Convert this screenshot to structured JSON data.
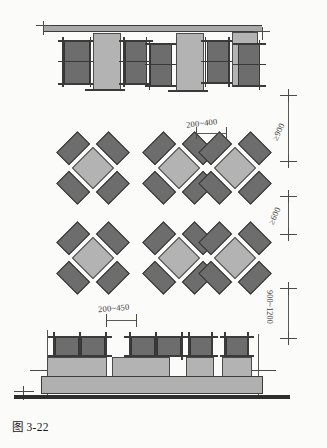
{
  "figure": {
    "caption": "图 3-22",
    "caption_number": "3-22"
  },
  "colors": {
    "background": "#fbfbfa",
    "table_fill": "#b3b3b3",
    "chair_fill": "#6d6d6d",
    "outline": "#3c3c3c",
    "dimension_line": "#5a5a5a",
    "floor_line": "#2e2e2e"
  },
  "dimensions": [
    {
      "id": "dim-clearance-900",
      "label": "≥900",
      "orientation": "vertical",
      "position": "right",
      "describes": "aisle clearance between wall-side seating row and first diamond table row"
    },
    {
      "id": "dim-clearance-600",
      "label": "≥600",
      "orientation": "vertical",
      "position": "right",
      "describes": "clearance between diamond table rows"
    },
    {
      "id": "dim-clearance-900-1200",
      "label": "900~1200",
      "orientation": "vertical",
      "position": "right",
      "describes": "clearance between last diamond row and counter seating"
    },
    {
      "id": "dim-spacing-200-400",
      "label": "200~400",
      "orientation": "horizontal",
      "position": "upper-middle",
      "describes": "gap between adjacent diamond table clusters"
    },
    {
      "id": "dim-spacing-200-450",
      "label": "200~450",
      "orientation": "horizontal",
      "position": "lower-middle",
      "describes": "gap between adjacent chairs along the counter"
    }
  ],
  "sections": {
    "top": {
      "name": "wall-side-seating-elevation",
      "wall_label": "",
      "unit_count": 4
    },
    "middle": {
      "name": "diamond-table-cluster-plan",
      "rows": 2,
      "columns": 3,
      "chairs_per_table": 4
    },
    "bottom": {
      "name": "counter-seating-plan",
      "unit_count": 3
    }
  }
}
